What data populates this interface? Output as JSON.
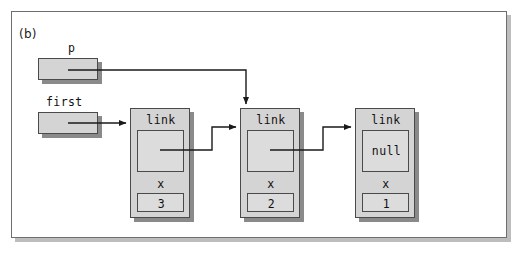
{
  "figure": {
    "panel_label": "(b)",
    "background_color": "#ffffff",
    "frame_border_color": "#6e6e6e",
    "frame_shadow_color": "#bdbdbd",
    "node_fill_color": "#d4d4d4",
    "field_fill_color": "#dcdcdc",
    "outline_color": "#4a4a4a",
    "shadow_color": "#8a8a8a",
    "connector_color": "#1a1a1a"
  },
  "pointers": [
    {
      "name": "p",
      "label": "p",
      "target_node_index": 1,
      "route": "right-then-down"
    },
    {
      "name": "first",
      "label": "first",
      "target_node_index": 0,
      "route": "straight-right"
    }
  ],
  "nodes": [
    {
      "link_label": "link",
      "link_value": "",
      "data_label": "x",
      "data_value": "3",
      "link_target": "node-2"
    },
    {
      "link_label": "link",
      "link_value": "",
      "data_label": "x",
      "data_value": "2",
      "link_target": "node-3"
    },
    {
      "link_label": "link",
      "link_value": "null",
      "data_label": "x",
      "data_value": "1",
      "link_target": "none"
    }
  ]
}
